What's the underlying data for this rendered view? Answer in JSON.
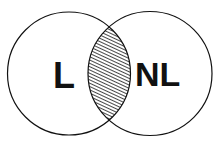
{
  "diagram": {
    "type": "venn",
    "sets": [
      {
        "id": "left",
        "label": "L",
        "cx": 69,
        "cy": 73.5,
        "r": 61.5
      },
      {
        "id": "right",
        "label": "NL",
        "cx": 150,
        "cy": 73.5,
        "r": 62
      }
    ],
    "intersection": {
      "fill": "hatched",
      "hatch_direction": "diagonal-down-right"
    },
    "colors": {
      "stroke": "#111111",
      "background": "#ffffff",
      "hatch": "#333333"
    }
  }
}
